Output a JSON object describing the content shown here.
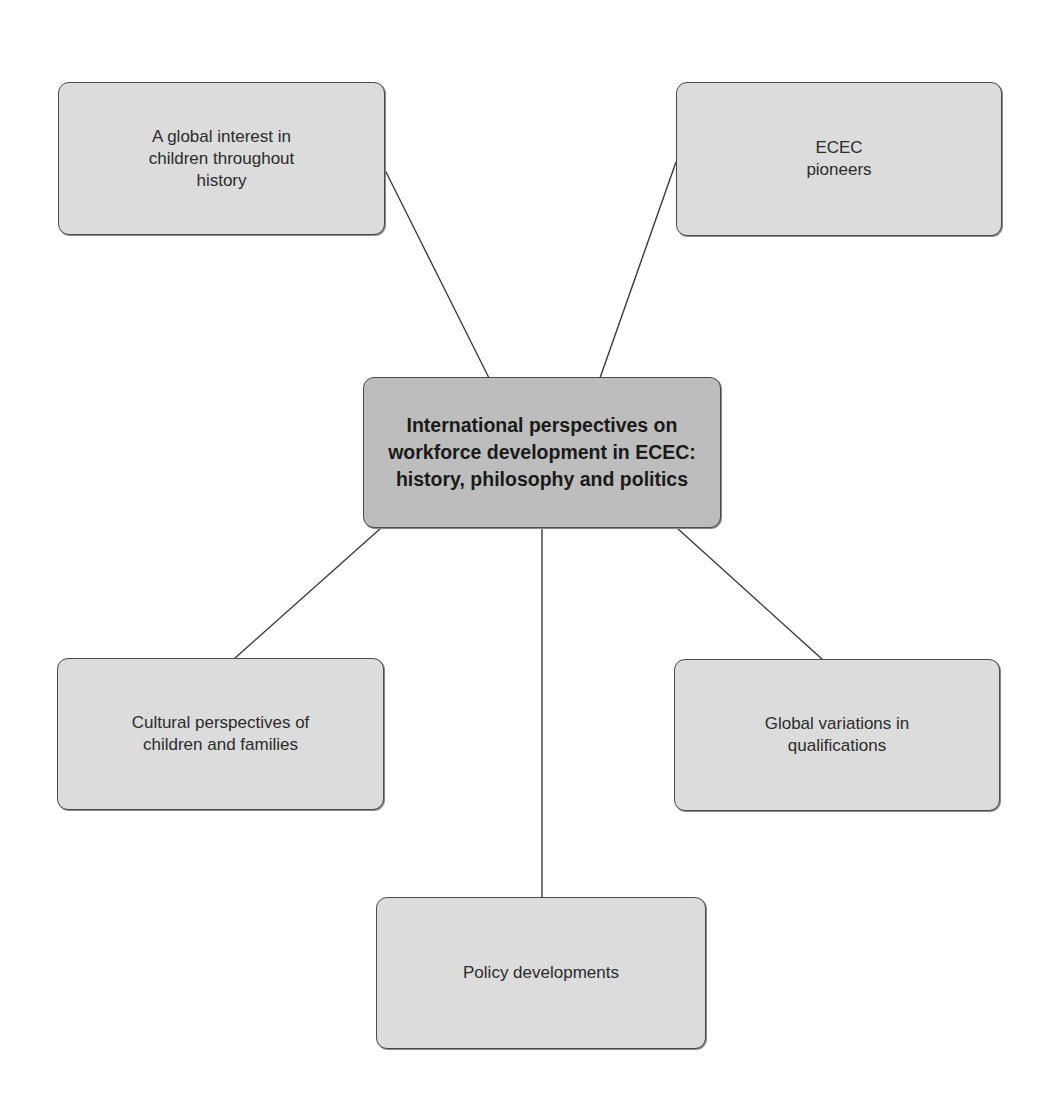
{
  "diagram": {
    "type": "mind-map",
    "center": {
      "label": "International perspectives on\nworkforce development in ECEC:\nhistory, philosophy and politics",
      "fill": "#bdbdbd"
    },
    "branches": [
      {
        "id": "top-left",
        "label": "A global interest in\nchildren throughout\nhistory",
        "fill": "#dcdcdc"
      },
      {
        "id": "top-right",
        "label": "ECEC\npioneers",
        "fill": "#dcdcdc"
      },
      {
        "id": "bottom-left",
        "label": "Cultural perspectives of\nchildren and families",
        "fill": "#dcdcdc"
      },
      {
        "id": "bottom-right",
        "label": "Global variations in\nqualifications",
        "fill": "#dcdcdc"
      },
      {
        "id": "bottom",
        "label": "Policy developments",
        "fill": "#dcdcdc"
      }
    ],
    "connector_color": "#3a3a3a",
    "border_color": "#4a4a4a"
  }
}
